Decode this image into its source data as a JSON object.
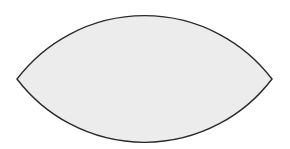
{
  "diagram": {
    "shape": "vesica-lens",
    "fill_color": "#ececec",
    "stroke_color": "#2a2a2a",
    "left_tip": [
      17,
      79
    ],
    "right_tip": [
      272,
      79
    ],
    "top_y": 15,
    "bottom_y": 142,
    "arc_radius": 160
  }
}
